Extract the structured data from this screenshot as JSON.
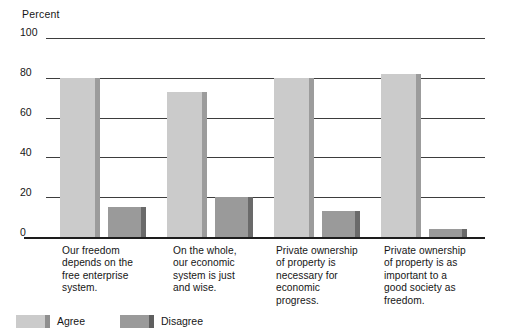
{
  "chart_data": {
    "type": "bar",
    "title": "",
    "xlabel": "",
    "ylabel": "Percent",
    "ylim": [
      0,
      100
    ],
    "yticks": [
      0,
      20,
      40,
      60,
      80,
      100
    ],
    "grid": true,
    "legend_position": "bottom",
    "categories": [
      "Our freedom depends on the free enterprise system.",
      "On the whole, our economic system is just and wise.",
      "Private ownership of property is necessary for economic progress.",
      "Private ownership of property is as important to a good society as freedom."
    ],
    "series": [
      {
        "name": "Agree",
        "color": "#cbcbcb",
        "values": [
          80,
          73,
          80,
          82
        ]
      },
      {
        "name": "Disagree",
        "color": "#9a9a9a",
        "values": [
          15,
          20,
          13,
          4
        ]
      }
    ]
  },
  "axis": {
    "percent_label": "Percent",
    "tick_100": "100",
    "tick_80": "80",
    "tick_60": "60",
    "tick_40": "40",
    "tick_20": "20",
    "tick_0": "0"
  },
  "categories": {
    "c0_l0": "Our freedom",
    "c0_l1": "depends on the",
    "c0_l2": "free enterprise",
    "c0_l3": "system.",
    "c1_l0": "On the whole,",
    "c1_l1": "our economic",
    "c1_l2": "system is just",
    "c1_l3": "and wise.",
    "c2_l0": "Private ownership",
    "c2_l1": "of property is",
    "c2_l2": "necessary for",
    "c2_l3": "economic",
    "c2_l4": "progress.",
    "c3_l0": "Private ownership",
    "c3_l1": "of property is as",
    "c3_l2": "important to a",
    "c3_l3": "good society as",
    "c3_l4": "freedom."
  },
  "legend": {
    "agree": "Agree",
    "disagree": "Disagree"
  }
}
